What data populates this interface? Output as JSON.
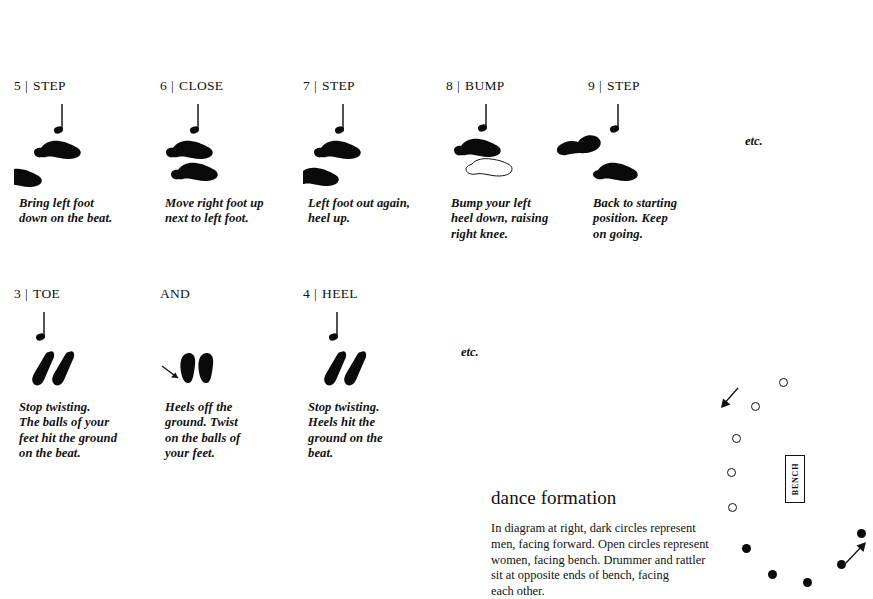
{
  "page": {
    "background_color": "#ffffff",
    "ink_color": "#0a0a0a"
  },
  "steps": [
    {
      "id": "step-5-step",
      "number": "5",
      "separator": "|",
      "name": "STEP",
      "caption": "Bring left foot\ndown on the beat.",
      "note": "quarter-note",
      "feet": [
        {
          "kind": "filled",
          "style": "angled-shoe",
          "role": "right-foot"
        },
        {
          "kind": "filled",
          "style": "angled-shoe",
          "role": "left-foot"
        }
      ]
    },
    {
      "id": "step-6-close",
      "number": "6",
      "separator": "|",
      "name": "CLOSE",
      "caption": "Move right foot up\nnext to left foot.",
      "note": "quarter-note",
      "feet": [
        {
          "kind": "filled",
          "style": "angled-shoe",
          "role": "right-foot"
        },
        {
          "kind": "filled",
          "style": "angled-shoe",
          "role": "left-foot"
        }
      ]
    },
    {
      "id": "step-7-step",
      "number": "7",
      "separator": "|",
      "name": "STEP",
      "caption": "Left foot out again,\nheel up.",
      "note": "quarter-note",
      "feet": [
        {
          "kind": "filled",
          "style": "angled-shoe",
          "role": "right-foot"
        },
        {
          "kind": "filled",
          "style": "angled-shoe",
          "role": "left-foot"
        }
      ]
    },
    {
      "id": "step-8-bump",
      "number": "8",
      "separator": "|",
      "name": "BUMP",
      "caption": "Bump your left\nheel down, raising\nright knee.",
      "note": "quarter-note",
      "feet": [
        {
          "kind": "filled",
          "style": "angled-shoe",
          "role": "right-foot"
        },
        {
          "kind": "outline",
          "style": "angled-shoe",
          "role": "left-foot-lifted"
        }
      ]
    },
    {
      "id": "step-9-step",
      "number": "9",
      "separator": "|",
      "name": "STEP",
      "caption": "Back to starting\nposition. Keep\non going.",
      "note": "quarter-note",
      "feet": [
        {
          "kind": "filled",
          "style": "angled-shoe",
          "role": "left-foot"
        },
        {
          "kind": "filled",
          "style": "angled-shoe",
          "role": "right-foot"
        }
      ]
    },
    {
      "id": "step-3-toe",
      "number": "3",
      "separator": "|",
      "name": "TOE",
      "caption": "Stop twisting.\nThe balls of your\nfeet hit the ground\non the beat.",
      "note": "quarter-note",
      "feet": [
        {
          "kind": "filled",
          "style": "tilted-sole",
          "role": "left-foot"
        },
        {
          "kind": "filled",
          "style": "tilted-sole",
          "role": "right-foot"
        }
      ]
    },
    {
      "id": "step-and",
      "number": "",
      "separator": "",
      "name": "AND",
      "caption": "Heels off the\nground. Twist\non the balls of\nyour feet.",
      "note": "none",
      "feet": [
        {
          "kind": "filled",
          "style": "upright-sole",
          "role": "left-foot"
        },
        {
          "kind": "filled",
          "style": "upright-sole",
          "role": "right-foot"
        }
      ],
      "arrow": "arrow-down-right"
    },
    {
      "id": "step-4-heel",
      "number": "4",
      "separator": "|",
      "name": "HEEL",
      "caption": "Stop twisting.\nHeels hit the\nground on the\nbeat.",
      "note": "quarter-note",
      "feet": [
        {
          "kind": "filled",
          "style": "tilted-sole",
          "role": "left-foot"
        },
        {
          "kind": "filled",
          "style": "tilted-sole",
          "role": "right-foot"
        }
      ]
    }
  ],
  "etc_markers": [
    {
      "id": "etc-row-1",
      "label": "etc."
    },
    {
      "id": "etc-row-2",
      "label": "etc."
    }
  ],
  "formation": {
    "title": "dance formation",
    "body": "In diagram at right, dark circles represent\nmen, facing forward. Open circles represent\nwomen, facing bench. Drummer and rattler\nsit at opposite ends of bench, facing\neach other.",
    "bench_label": "BENCH",
    "legend": {
      "dark_circle_meaning": "men, facing forward",
      "open_circle_meaning": "women, facing bench"
    },
    "diagram": {
      "open_circles": [
        {
          "x": 79,
          "y": 18
        },
        {
          "x": 51,
          "y": 42
        },
        {
          "x": 32,
          "y": 74
        },
        {
          "x": 27,
          "y": 108
        },
        {
          "x": 28,
          "y": 143
        }
      ],
      "dark_circles": [
        {
          "x": 42,
          "y": 184
        },
        {
          "x": 68,
          "y": 210
        },
        {
          "x": 103,
          "y": 218
        },
        {
          "x": 137,
          "y": 200
        },
        {
          "x": 157,
          "y": 169
        }
      ],
      "arrows": [
        {
          "id": "arrow-women-direction",
          "x": 20,
          "y": 32,
          "direction": "down-left"
        },
        {
          "id": "arrow-men-direction",
          "x": 146,
          "y": 190,
          "direction": "up-right"
        }
      ],
      "bench": {
        "x": 85,
        "y": 95,
        "width": 20,
        "height": 48
      }
    }
  }
}
